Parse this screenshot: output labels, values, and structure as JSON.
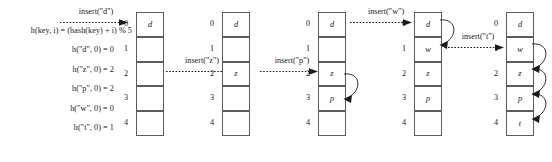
{
  "diagram": {
    "table_size": 5,
    "slot_indices": [
      "0",
      "1",
      "2",
      "3",
      "4"
    ],
    "colors": {
      "cell_border": "#5d5d5d",
      "cell_fill": "#ffffff",
      "text": "#1a1a1a",
      "arrow": "#1a1a1a"
    }
  },
  "formula": {
    "hash_function": "h(key, i) = (hash(key) + i) % 5",
    "computations": [
      "h(\"d\", 0) = 0",
      "h(\"z\", 0) = 2",
      "h(\"p\", 0) = 2",
      "h(\"w\", 0) = 0",
      "h(\"t\", 0) = 1"
    ]
  },
  "inserts": [
    {
      "label": "insert(\"d\")",
      "key": "d",
      "target_row": 0
    },
    {
      "label": "insert(\"z\")",
      "key": "z",
      "target_row": 2
    },
    {
      "label": "insert(\"p\")",
      "key": "p",
      "target_row": 2
    },
    {
      "label": "insert(\"w\")",
      "key": "w",
      "target_row": 0
    },
    {
      "label": "insert(\"t\")",
      "key": "t",
      "target_row": 1
    }
  ],
  "tables": [
    {
      "name": "state-after-insert-d",
      "slots": [
        "d",
        "",
        "",
        "",
        ""
      ],
      "probes": []
    },
    {
      "name": "state-after-insert-z",
      "slots": [
        "d",
        "",
        "z",
        "",
        ""
      ],
      "probes": []
    },
    {
      "name": "state-after-insert-p",
      "slots": [
        "d",
        "",
        "z",
        "p",
        ""
      ],
      "probes": [
        {
          "from": 2,
          "to": 3
        }
      ]
    },
    {
      "name": "state-after-insert-w",
      "slots": [
        "d",
        "w",
        "z",
        "p",
        ""
      ],
      "probes": [
        {
          "from": 0,
          "to": 1
        }
      ]
    },
    {
      "name": "state-after-insert-t",
      "slots": [
        "d",
        "w",
        "z",
        "p",
        "t"
      ],
      "probes": [
        {
          "from": 1,
          "to": 2
        },
        {
          "from": 2,
          "to": 3
        },
        {
          "from": 3,
          "to": 4
        }
      ]
    }
  ]
}
